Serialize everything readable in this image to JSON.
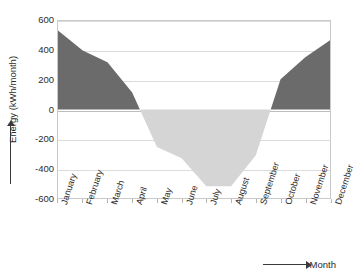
{
  "chart_data": {
    "type": "area",
    "title": "",
    "subtitle": "",
    "xlabel": "Month",
    "ylabel": "Energy (kWh/month)",
    "categories": [
      "January",
      "February",
      "March",
      "April",
      "May",
      "June",
      "July",
      "August",
      "September",
      "October",
      "November",
      "December"
    ],
    "values": [
      535,
      400,
      320,
      115,
      -255,
      -330,
      -520,
      -520,
      -310,
      205,
      355,
      470
    ],
    "series": [
      {
        "name": "Energy",
        "values": [
          535,
          400,
          320,
          115,
          -255,
          -330,
          -520,
          -520,
          -310,
          205,
          355,
          470
        ]
      }
    ],
    "ylim": [
      -600,
      600
    ],
    "yticks": [
      600,
      400,
      200,
      0,
      -200,
      -400,
      -600
    ],
    "ytick_labels": [
      "600",
      "400",
      "200",
      "0",
      "-200",
      "-400",
      "-600"
    ],
    "grid": true,
    "legend": "none",
    "legend_position": "none",
    "zero_line": 0,
    "colors": {
      "positive_fill": "#6b6b6b",
      "negative_fill": "#d5d5d5",
      "gridline": "#dcdcdc",
      "axis": "#c9c9c9",
      "text": "#2b2b2b",
      "arrow": "#3a3a3a"
    },
    "annotations": []
  },
  "axes": {
    "y_arrow_icon": "up-arrow-icon",
    "x_arrow_icon": "right-arrow-icon"
  }
}
